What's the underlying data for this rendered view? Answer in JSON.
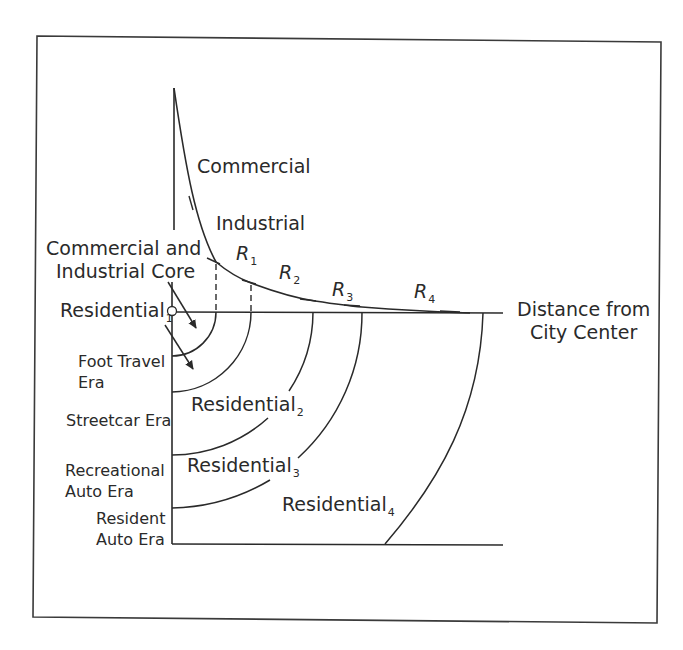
{
  "diagram": {
    "type": "bid-rent curve with concentric residential zones",
    "x_axis_label_line1": "Distance from",
    "x_axis_label_line2": "City Center",
    "curve_segments": {
      "commercial": "Commercial",
      "industrial": "Industrial",
      "r1": {
        "base": "R",
        "sub": "1"
      },
      "r2": {
        "base": "R",
        "sub": "2"
      },
      "r3": {
        "base": "R",
        "sub": "3"
      },
      "r4": {
        "base": "R",
        "sub": "4"
      }
    },
    "core_label_line1": "Commercial and",
    "core_label_line2": "Industrial Core",
    "residential_zones": [
      {
        "base": "Residential",
        "sub": "1"
      },
      {
        "base": "Residential",
        "sub": "2"
      },
      {
        "base": "Residential",
        "sub": "3"
      },
      {
        "base": "Residential",
        "sub": "4"
      }
    ],
    "eras": [
      {
        "line1": "Foot Travel",
        "line2": "Era"
      },
      {
        "line1": "Streetcar Era",
        "line2": ""
      },
      {
        "line1": "Recreational",
        "line2": "Auto Era"
      },
      {
        "line1": "Resident",
        "line2": "Auto Era"
      }
    ],
    "colors": {
      "ink": "#2a2a2a",
      "background": "#ffffff"
    }
  }
}
